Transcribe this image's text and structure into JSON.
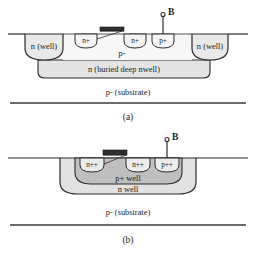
{
  "figure": {
    "title_a_caption": "(a)",
    "title_b_caption": "(b)",
    "colors": {
      "line": "#2b2b2b",
      "nwell_fill": "#e9e9e9",
      "deep_nwell_fill": "#e4e4e4",
      "pwell_fill": "#bfbfbf",
      "nwell_b_fill": "#e2e2e2",
      "diffusion_fill": "#f2f2f2",
      "gate_fill": "#2e2e2e",
      "substrate_text": "#1a1a1a",
      "background": "#ffffff"
    }
  },
  "panel_a": {
    "caption": "(a)",
    "terminal": {
      "label": "B"
    },
    "regions": {
      "left_nwell": "n (well)",
      "right_nwell": "n (well)",
      "body": "p-",
      "deep_nwell": "n (buried deep nwell)",
      "substrate": "p- (substrate)"
    },
    "diffusions": [
      {
        "label": "n+"
      },
      {
        "label": "n+"
      },
      {
        "label": "p+"
      }
    ]
  },
  "panel_b": {
    "caption": "(b)",
    "terminal": {
      "label": "B"
    },
    "regions": {
      "p_well": "p+ well",
      "n_well": "n well",
      "substrate": "p- (substrate)"
    },
    "diffusions": [
      {
        "label": "n++"
      },
      {
        "label": "n++"
      },
      {
        "label": "p++"
      }
    ]
  }
}
